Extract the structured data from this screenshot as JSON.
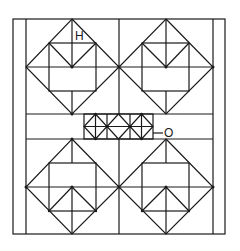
{
  "diagram": {
    "type": "geometric-pattern",
    "labels": {
      "h": "H",
      "o": "O"
    },
    "stroke_color": "#1a1a1a",
    "background": "#ffffff",
    "frame": {
      "outer": [
        13,
        19,
        225,
        234
      ],
      "inner_left_x": 26,
      "inner_right_x": 213
    },
    "center_strip": {
      "y_top": 114,
      "y_bottom": 139,
      "small_diamond_count": 3
    },
    "large_diamonds": [
      {
        "name": "top-left",
        "top": [
          72,
          19
        ],
        "bottom": [
          72,
          114
        ],
        "left": [
          26,
          67
        ],
        "right": [
          119,
          67
        ],
        "orientation": "down"
      },
      {
        "name": "top-right",
        "top": [
          166,
          19
        ],
        "bottom": [
          166,
          114
        ],
        "left": [
          119,
          67
        ],
        "right": [
          213,
          67
        ],
        "orientation": "down"
      },
      {
        "name": "bottom-left",
        "top": [
          72,
          139
        ],
        "bottom": [
          72,
          234
        ],
        "left": [
          26,
          187
        ],
        "right": [
          119,
          187
        ],
        "orientation": "up"
      },
      {
        "name": "bottom-right",
        "top": [
          166,
          139
        ],
        "bottom": [
          166,
          234
        ],
        "left": [
          119,
          187
        ],
        "right": [
          213,
          187
        ],
        "orientation": "up"
      }
    ]
  }
}
